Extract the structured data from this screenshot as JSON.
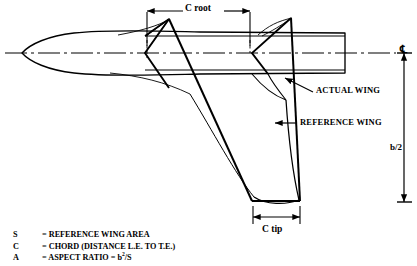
{
  "diagram": {
    "title_labels": {
      "c_root": "C root",
      "c_tip": "C tip",
      "actual_wing": "ACTUAL WING",
      "reference_wing": "REFERENCE WING",
      "half_span": "b/2",
      "centerline_symbol": "℄"
    },
    "colors": {
      "line": "#000000",
      "background": "#ffffff",
      "text": "#000000"
    }
  },
  "legend": {
    "rows": [
      {
        "symbol": "S",
        "definition_prefix": "= REFERENCE WING AREA",
        "definition_sup": "",
        "definition_suffix": ""
      },
      {
        "symbol": "C",
        "definition_prefix": "= CHORD (DISTANCE L.E. TO T.E.)",
        "definition_sup": "",
        "definition_suffix": ""
      },
      {
        "symbol": "A",
        "definition_prefix": "= ASPECT RATIO = b",
        "definition_sup": "2",
        "definition_suffix": "/S"
      }
    ]
  }
}
